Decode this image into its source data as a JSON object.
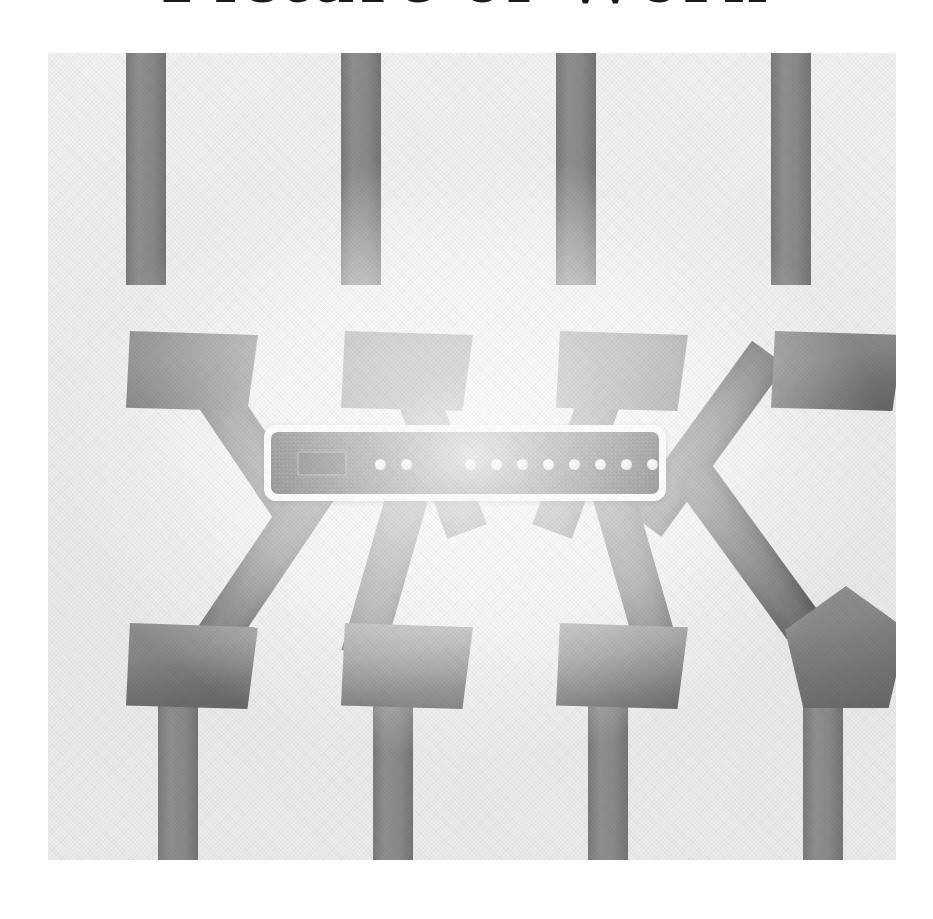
{
  "page": {
    "title": "Picture of Work",
    "background_color": "#ffffff"
  },
  "figure": {
    "name": "network-topology-illustration",
    "caption": "Picture of Work",
    "canvas": {
      "x": 48,
      "y": 53,
      "width": 848,
      "height": 807,
      "background_color": "#ededed",
      "texture": "halftone-scan"
    },
    "palette": {
      "background": "#ededed",
      "cable_vertical": "#8a8a8a",
      "cable_diagonal": "#6a6a6a",
      "node_fill": "#868686",
      "switch_border": "#ffffff",
      "switch_body": "#0d0d0d",
      "led": "#e2e2e2",
      "port": "#000000",
      "title_text": "#1a1a1a"
    },
    "central_device": {
      "label": "network-switch",
      "x": 264,
      "y": 425,
      "width": 402,
      "height": 76,
      "border_color": "#ffffff",
      "body_color": "#0d0d0d",
      "port_count": 1,
      "status_led_count": 2,
      "port_led_count": 11,
      "total_led_count": 13
    },
    "nodes": [
      {
        "id": "node-top-1",
        "shape": "trapezoid",
        "x": 78,
        "y": 278,
        "width": 132,
        "height": 80,
        "row": "top",
        "column": 1
      },
      {
        "id": "node-top-2",
        "shape": "trapezoid",
        "x": 293,
        "y": 278,
        "width": 132,
        "height": 80,
        "row": "top",
        "column": 2
      },
      {
        "id": "node-top-3",
        "shape": "trapezoid",
        "x": 508,
        "y": 278,
        "width": 132,
        "height": 80,
        "row": "top",
        "column": 3
      },
      {
        "id": "node-top-4",
        "shape": "trapezoid",
        "x": 723,
        "y": 278,
        "width": 132,
        "height": 80,
        "row": "top",
        "column": 4
      },
      {
        "id": "node-bottom-1",
        "shape": "trapezoid",
        "x": 78,
        "y": 570,
        "width": 132,
        "height": 86,
        "row": "bottom",
        "column": 1
      },
      {
        "id": "node-bottom-2",
        "shape": "trapezoid",
        "x": 293,
        "y": 570,
        "width": 132,
        "height": 86,
        "row": "bottom",
        "column": 2
      },
      {
        "id": "node-bottom-3",
        "shape": "trapezoid",
        "x": 508,
        "y": 570,
        "width": 132,
        "height": 86,
        "row": "bottom",
        "column": 3
      },
      {
        "id": "node-bottom-4",
        "shape": "pentagon",
        "x": 737,
        "y": 533,
        "width": 122,
        "height": 122,
        "row": "bottom",
        "column": 4
      }
    ],
    "cable_count_vertical": 8,
    "cable_count_diagonal": 8
  },
  "chart_data": {
    "type": "diagram",
    "title": "Picture of Work",
    "subtype": "star-network-topology",
    "hub": "network-switch",
    "spokes": 8,
    "endpoints": 8,
    "uplinks": 8
  }
}
